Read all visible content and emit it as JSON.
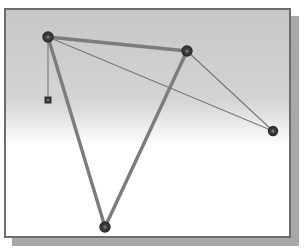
{
  "figure": {
    "title": "",
    "caption": "",
    "frame": {
      "x": 4,
      "y": 8,
      "width": 287,
      "height": 230,
      "border_color": "#6d6d6d",
      "border_width": 2,
      "shadow_color": "#a8a8a8",
      "shadow_offset_x": 8,
      "shadow_offset_y": 8
    },
    "background": {
      "type": "vertical-gradient",
      "top_color": "#c7c7c7",
      "mid_color": "#d4d4d4",
      "bottom_color": "#ffffff",
      "gradient_stops": [
        "0%",
        "40%",
        "60%",
        "100%"
      ]
    }
  },
  "chart_data": {
    "type": "scatter",
    "title": "",
    "xlabel": "",
    "ylabel": "",
    "grid": false,
    "legend": "none",
    "axis_visible": false,
    "xlim": [
      0,
      287
    ],
    "ylim": [
      0,
      230
    ],
    "coordinate_space": "pixels-within-frame",
    "node_style": {
      "shape_circle_radius": 5,
      "shape_square_size": 5,
      "fill_color": "#3b3b3b",
      "stroke_color": "#2a2a2a",
      "inner_highlight_color": "#7a7a7a",
      "inner_highlight_radius": 1.6
    },
    "edge_style": {
      "thick_color": "#7c7c7c",
      "thick_width": 3.4,
      "thin_color": "#777777",
      "thin_width": 1.1
    },
    "nodes": [
      {
        "id": "n1",
        "label": "",
        "x": 42,
        "y": 27,
        "shape": "circle",
        "size": 5
      },
      {
        "id": "n2",
        "label": "",
        "x": 181,
        "y": 41,
        "shape": "circle",
        "size": 5
      },
      {
        "id": "n3",
        "label": "",
        "x": 267,
        "y": 121,
        "shape": "circle",
        "size": 4.5
      },
      {
        "id": "n4",
        "label": "",
        "x": 99,
        "y": 217,
        "shape": "circle",
        "size": 5
      },
      {
        "id": "n5",
        "label": "",
        "x": 42,
        "y": 90,
        "shape": "square",
        "size": 3
      }
    ],
    "edges": [
      {
        "from": "n1",
        "to": "n2",
        "weight": "thick"
      },
      {
        "from": "n1",
        "to": "n4",
        "weight": "thick"
      },
      {
        "from": "n2",
        "to": "n4",
        "weight": "thick"
      },
      {
        "from": "n1",
        "to": "n3",
        "weight": "thin"
      },
      {
        "from": "n2",
        "to": "n3",
        "weight": "thin"
      },
      {
        "from": "n1",
        "to": "n5",
        "weight": "thin"
      }
    ]
  }
}
